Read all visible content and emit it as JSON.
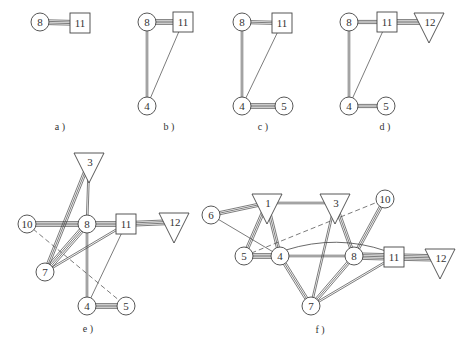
{
  "figure": {
    "panels": [
      {
        "id": "a",
        "label": "a )",
        "label_pos": [
          60,
          130
        ],
        "nodes": [
          {
            "id": "8",
            "shape": "circle",
            "x": 40,
            "y": 22
          },
          {
            "id": "11",
            "shape": "square",
            "x": 80,
            "y": 23
          }
        ],
        "edges": [
          {
            "from": "8",
            "to": "11",
            "lines": 4,
            "style": "solid"
          }
        ]
      },
      {
        "id": "b",
        "label": "b )",
        "label_pos": [
          169,
          130
        ],
        "nodes": [
          {
            "id": "8",
            "shape": "circle",
            "x": 147,
            "y": 22
          },
          {
            "id": "11",
            "shape": "square",
            "x": 183,
            "y": 22
          },
          {
            "id": "4",
            "shape": "circle",
            "x": 147,
            "y": 106
          }
        ],
        "edges": [
          {
            "from": "8",
            "to": "11",
            "lines": 4,
            "style": "solid"
          },
          {
            "from": "8",
            "to": "4",
            "lines": 2,
            "style": "solid"
          },
          {
            "from": "11",
            "to": "4",
            "lines": 1,
            "style": "solid"
          }
        ]
      },
      {
        "id": "c",
        "label": "c )",
        "label_pos": [
          263,
          130
        ],
        "nodes": [
          {
            "id": "8",
            "shape": "circle",
            "x": 242,
            "y": 22
          },
          {
            "id": "11",
            "shape": "square",
            "x": 282,
            "y": 23
          },
          {
            "id": "4",
            "shape": "circle",
            "x": 242,
            "y": 106
          },
          {
            "id": "5",
            "shape": "circle",
            "x": 284,
            "y": 106
          }
        ],
        "edges": [
          {
            "from": "8",
            "to": "11",
            "lines": 3,
            "style": "solid"
          },
          {
            "from": "8",
            "to": "4",
            "lines": 2,
            "style": "solid"
          },
          {
            "from": "11",
            "to": "4",
            "lines": 1,
            "style": "solid"
          },
          {
            "from": "4",
            "to": "5",
            "lines": 4,
            "style": "solid"
          }
        ]
      },
      {
        "id": "d",
        "label": "d )",
        "label_pos": [
          385,
          130
        ],
        "nodes": [
          {
            "id": "8",
            "shape": "circle",
            "x": 349,
            "y": 22
          },
          {
            "id": "11",
            "shape": "square",
            "x": 387,
            "y": 22
          },
          {
            "id": "12",
            "shape": "triangle",
            "x": 429,
            "y": 22
          },
          {
            "id": "4",
            "shape": "circle",
            "x": 349,
            "y": 106
          },
          {
            "id": "5",
            "shape": "circle",
            "x": 386,
            "y": 106
          }
        ],
        "edges": [
          {
            "from": "8",
            "to": "11",
            "lines": 3,
            "style": "solid"
          },
          {
            "from": "11",
            "to": "12",
            "lines": 4,
            "style": "solid"
          },
          {
            "from": "8",
            "to": "4",
            "lines": 2,
            "style": "solid"
          },
          {
            "from": "11",
            "to": "4",
            "lines": 1,
            "style": "solid"
          },
          {
            "from": "4",
            "to": "5",
            "lines": 3,
            "style": "solid"
          }
        ]
      },
      {
        "id": "e",
        "label": "e )",
        "label_pos": [
          88,
          332
        ],
        "nodes": [
          {
            "id": "3",
            "shape": "triangle",
            "x": 89,
            "y": 162
          },
          {
            "id": "10",
            "shape": "circle",
            "x": 27,
            "y": 224
          },
          {
            "id": "8",
            "shape": "circle",
            "x": 87,
            "y": 224
          },
          {
            "id": "11",
            "shape": "square",
            "x": 126,
            "y": 224
          },
          {
            "id": "12",
            "shape": "triangle",
            "x": 174,
            "y": 222
          },
          {
            "id": "7",
            "shape": "circle",
            "x": 45,
            "y": 272
          },
          {
            "id": "4",
            "shape": "circle",
            "x": 87,
            "y": 306
          },
          {
            "id": "5",
            "shape": "circle",
            "x": 126,
            "y": 306
          }
        ],
        "edges": [
          {
            "from": "3",
            "to": "8",
            "lines": 2,
            "style": "solid"
          },
          {
            "from": "3",
            "to": "7",
            "lines": 3,
            "style": "solid"
          },
          {
            "from": "10",
            "to": "8",
            "lines": 4,
            "style": "solid"
          },
          {
            "from": "8",
            "to": "11",
            "lines": 4,
            "style": "solid"
          },
          {
            "from": "11",
            "to": "12",
            "lines": 4,
            "style": "solid"
          },
          {
            "from": "8",
            "to": "7",
            "lines": 4,
            "style": "solid"
          },
          {
            "from": "11",
            "to": "7",
            "lines": 2,
            "style": "solid"
          },
          {
            "from": "8",
            "to": "4",
            "lines": 2,
            "style": "solid"
          },
          {
            "from": "11",
            "to": "4",
            "lines": 1,
            "style": "solid"
          },
          {
            "from": "4",
            "to": "5",
            "lines": 4,
            "style": "solid"
          },
          {
            "from": "10",
            "to": "5",
            "lines": 1,
            "style": "dashed"
          }
        ]
      },
      {
        "id": "f",
        "label": "f )",
        "label_pos": [
          320,
          333
        ],
        "nodes": [
          {
            "id": "1",
            "shape": "triangle",
            "x": 267,
            "y": 203
          },
          {
            "id": "3",
            "shape": "triangle",
            "x": 335,
            "y": 203
          },
          {
            "id": "10",
            "shape": "circle",
            "x": 385,
            "y": 199
          },
          {
            "id": "6",
            "shape": "circle",
            "x": 211,
            "y": 215
          },
          {
            "id": "5",
            "shape": "circle",
            "x": 244,
            "y": 256
          },
          {
            "id": "4",
            "shape": "circle",
            "x": 280,
            "y": 256
          },
          {
            "id": "8",
            "shape": "circle",
            "x": 354,
            "y": 256
          },
          {
            "id": "11",
            "shape": "square",
            "x": 394,
            "y": 257
          },
          {
            "id": "12",
            "shape": "triangle",
            "x": 440,
            "y": 258
          },
          {
            "id": "7",
            "shape": "circle",
            "x": 311,
            "y": 306
          }
        ],
        "edges": [
          {
            "from": "6",
            "to": "1",
            "lines": 3,
            "style": "solid"
          },
          {
            "from": "6",
            "to": "4",
            "lines": 1,
            "style": "solid"
          },
          {
            "from": "1",
            "to": "3",
            "lines": 2,
            "style": "solid"
          },
          {
            "from": "1",
            "to": "5",
            "lines": 3,
            "style": "solid"
          },
          {
            "from": "1",
            "to": "4",
            "lines": 3,
            "style": "solid"
          },
          {
            "from": "5",
            "to": "4",
            "lines": 4,
            "style": "solid"
          },
          {
            "from": "5",
            "to": "10",
            "lines": 1,
            "style": "dashed"
          },
          {
            "from": "4",
            "to": "8",
            "lines": 2,
            "style": "solid"
          },
          {
            "from": "4",
            "to": "11",
            "lines": 1,
            "style": "curve"
          },
          {
            "from": "4",
            "to": "7",
            "lines": 3,
            "style": "solid"
          },
          {
            "from": "3",
            "to": "8",
            "lines": 3,
            "style": "solid"
          },
          {
            "from": "3",
            "to": "7",
            "lines": 2,
            "style": "solid"
          },
          {
            "from": "10",
            "to": "8",
            "lines": 3,
            "style": "solid"
          },
          {
            "from": "8",
            "to": "11",
            "lines": 5,
            "style": "solid"
          },
          {
            "from": "11",
            "to": "12",
            "lines": 5,
            "style": "solid"
          },
          {
            "from": "8",
            "to": "7",
            "lines": 3,
            "style": "solid"
          },
          {
            "from": "11",
            "to": "7",
            "lines": 2,
            "style": "solid"
          }
        ]
      }
    ]
  }
}
